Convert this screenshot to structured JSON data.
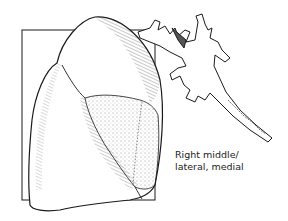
{
  "figure": {
    "highlighted_segment": "right middle lobe (lateral, medial)",
    "caption": {
      "line1": "Right middle/",
      "line2": "lateral, medial"
    },
    "colors": {
      "ink": "#1a1a1a",
      "background": "#ffffff",
      "stipple": "#333333"
    }
  }
}
